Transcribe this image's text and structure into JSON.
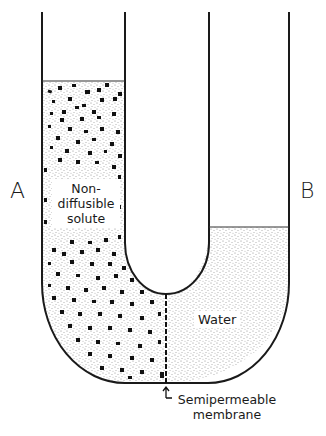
{
  "diagram": {
    "labels": {
      "left_arm": "A",
      "right_arm": "B",
      "solute_line1": "Non-",
      "solute_line2": "diffusible",
      "solute_line3": "solute",
      "water": "Water",
      "membrane_line1": "Semipermeable",
      "membrane_line2": "membrane"
    },
    "components": [
      {
        "id": "left-arm",
        "label": "A",
        "contents": "Non-diffusible solute solution (solute particles + water)",
        "fill_level_y": 81
      },
      {
        "id": "right-arm",
        "label": "B",
        "contents": "Water",
        "fill_level_y": 227
      },
      {
        "id": "membrane",
        "label": "Semipermeable membrane",
        "position": "bottom center of U-tube"
      }
    ],
    "colors": {
      "line": "#1a1a1a",
      "stipple": "#9a9a9a",
      "particle": "#111111",
      "background": "#ffffff"
    }
  }
}
